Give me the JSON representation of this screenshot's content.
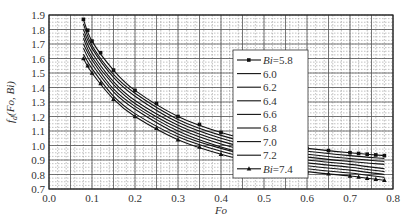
{
  "chart_data": {
    "type": "line",
    "title": "",
    "xlabel": "Fo",
    "ylabel": "f_d(Fo, Bi)",
    "xlim": [
      0.0,
      0.8
    ],
    "ylim": [
      0.7,
      1.9
    ],
    "xticks": [
      "0.0",
      "0.1",
      "0.2",
      "0.3",
      "0.4",
      "0.5",
      "0.6",
      "0.7",
      "0.8"
    ],
    "yticks": [
      "0.7",
      "0.8",
      "0.9",
      "1.0",
      "1.1",
      "1.2",
      "1.3",
      "1.4",
      "1.5",
      "1.6",
      "1.7",
      "1.8",
      "1.9"
    ],
    "grid": true,
    "legend_position": "upper-right-inside",
    "x": [
      0.08,
      0.1,
      0.15,
      0.2,
      0.3,
      0.4,
      0.5,
      0.6,
      0.7,
      0.78
    ],
    "series": [
      {
        "name": "Bi=5.8",
        "marker": "square",
        "values": [
          1.87,
          1.72,
          1.52,
          1.38,
          1.2,
          1.09,
          1.02,
          0.98,
          0.95,
          0.93
        ]
      },
      {
        "name": "6.0",
        "marker": "none",
        "values": [
          1.84,
          1.69,
          1.49,
          1.36,
          1.18,
          1.07,
          1.0,
          0.96,
          0.93,
          0.91
        ]
      },
      {
        "name": "6.2",
        "marker": "none",
        "values": [
          1.8,
          1.67,
          1.47,
          1.34,
          1.16,
          1.05,
          0.98,
          0.94,
          0.91,
          0.89
        ]
      },
      {
        "name": "6.4",
        "marker": "none",
        "values": [
          1.77,
          1.64,
          1.44,
          1.31,
          1.14,
          1.03,
          0.96,
          0.92,
          0.89,
          0.87
        ]
      },
      {
        "name": "6.6",
        "marker": "none",
        "values": [
          1.74,
          1.61,
          1.42,
          1.29,
          1.12,
          1.01,
          0.94,
          0.9,
          0.87,
          0.84
        ]
      },
      {
        "name": "6.8",
        "marker": "none",
        "values": [
          1.7,
          1.59,
          1.39,
          1.27,
          1.1,
          0.99,
          0.92,
          0.88,
          0.85,
          0.82
        ]
      },
      {
        "name": "7.0",
        "marker": "none",
        "values": [
          1.67,
          1.56,
          1.37,
          1.25,
          1.08,
          0.98,
          0.91,
          0.86,
          0.83,
          0.8
        ]
      },
      {
        "name": "7.2",
        "marker": "none",
        "values": [
          1.63,
          1.53,
          1.34,
          1.22,
          1.06,
          0.96,
          0.89,
          0.84,
          0.81,
          0.78
        ]
      },
      {
        "name": "Bi=7.4",
        "marker": "triangle",
        "values": [
          1.6,
          1.5,
          1.32,
          1.2,
          1.04,
          0.94,
          0.87,
          0.82,
          0.79,
          0.76
        ]
      }
    ]
  },
  "legend_labels": [
    "Bi=5.8",
    "6.0",
    "6.2",
    "6.4",
    "6.6",
    "6.8",
    "7.0",
    "7.2",
    "Bi=7.4"
  ]
}
